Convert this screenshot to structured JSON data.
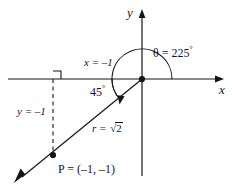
{
  "figure": {
    "axes": {
      "x_label": "x",
      "y_label": "y"
    },
    "labels": {
      "theta": "θ = 225",
      "theta_degree_symbol": "°",
      "theta_value": "225",
      "reference_angle": "45",
      "reference_angle_degree_symbol": "°",
      "x_component": "x = –1",
      "y_component": "y = –1",
      "radius_prefix": "r = ",
      "radius_radical_sign": "√",
      "radius_radicand": "2",
      "point_label": "P = (–1, –1)"
    },
    "colors": {
      "stroke": "#151515",
      "background": "#ffffff",
      "text": "#151515"
    },
    "geometry": {
      "origin_x": 142,
      "origin_y": 79,
      "point_x": 53,
      "point_y": 155,
      "theta_degrees": 225,
      "reference_angle_degrees": 45,
      "radius": 1.4142
    }
  }
}
